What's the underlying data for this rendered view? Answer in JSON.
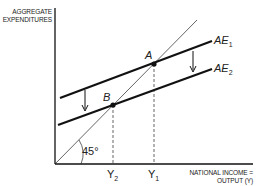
{
  "diagram": {
    "y_axis_label_line1": "AGGREGATE",
    "y_axis_label_line2": "EXPENDITURES",
    "x_axis_label_line1": "NATIONAL INCOME =",
    "x_axis_label_line2": "OUTPUT (Y)",
    "angle_label": "45°",
    "curves": [
      {
        "name": "AE",
        "sub": "1"
      },
      {
        "name": "AE",
        "sub": "2"
      }
    ],
    "points": [
      {
        "name": "A"
      },
      {
        "name": "B"
      }
    ],
    "x_ticks": [
      {
        "name": "Y",
        "sub": "2"
      },
      {
        "name": "Y",
        "sub": "1"
      }
    ],
    "colors": {
      "line": "#111111",
      "text": "#222222"
    }
  }
}
